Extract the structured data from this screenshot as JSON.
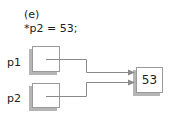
{
  "diagram": {
    "step_label": "(e)",
    "statement": "*p2 = 53;",
    "pointers": [
      {
        "name": "p1",
        "target": "value_cell"
      },
      {
        "name": "p2",
        "target": "value_cell"
      }
    ],
    "value_cell": {
      "value": "53"
    },
    "colors": {
      "border": "#9a9a9a",
      "shadow": "#b5b5b5",
      "arrow": "#8a8a8a",
      "text": "#222222"
    }
  }
}
